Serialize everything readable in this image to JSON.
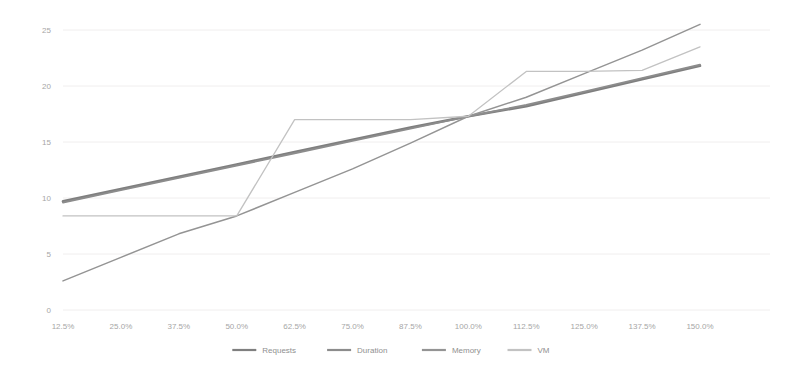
{
  "chart_data": {
    "type": "line",
    "title": "",
    "subtitle": "",
    "xlabel": "",
    "ylabel": "",
    "xlim": [
      0,
      13
    ],
    "ylim": [
      0,
      25
    ],
    "yticks": [
      0,
      5,
      10,
      15,
      20,
      25
    ],
    "ytick_labels": [
      "0",
      "5",
      "10",
      "15",
      "20",
      "25"
    ],
    "grid": true,
    "grid_axis": "y",
    "legend_position": "bottom",
    "categories": [
      "12.5%",
      "25.0%",
      "37.5%",
      "50.0%",
      "62.5%",
      "75.0%",
      "87.5%",
      "100.0%",
      "112.5%",
      "125.0%",
      "137.5%",
      "150.0%"
    ],
    "series": [
      {
        "name": "Requests",
        "color": "#7f7f7f",
        "width": 2.6,
        "values": [
          9.7,
          10.8,
          11.9,
          13.0,
          14.1,
          15.2,
          16.3,
          17.3,
          18.2,
          19.4,
          20.6,
          21.8
        ]
      },
      {
        "name": "Duration",
        "color": "#8c8c8c",
        "width": 1.9,
        "values": [
          9.6,
          10.7,
          11.8,
          12.9,
          14.0,
          15.1,
          16.2,
          17.3,
          18.3,
          19.5,
          20.7,
          21.9
        ]
      },
      {
        "name": "Memory",
        "color": "#949494",
        "width": 1.5,
        "values": [
          2.6,
          4.7,
          6.8,
          8.4,
          10.5,
          12.6,
          14.9,
          17.3,
          19.0,
          21.1,
          23.2,
          25.5
        ]
      },
      {
        "name": "VM",
        "color": "#c2c2c2",
        "width": 1.3,
        "values": [
          8.4,
          8.4,
          8.4,
          8.4,
          17.0,
          17.0,
          17.0,
          17.3,
          21.3,
          21.3,
          21.4,
          23.5
        ]
      }
    ]
  },
  "legend": {
    "items": [
      {
        "label": "Requests"
      },
      {
        "label": "Duration"
      },
      {
        "label": "Memory"
      },
      {
        "label": "VM"
      }
    ]
  }
}
